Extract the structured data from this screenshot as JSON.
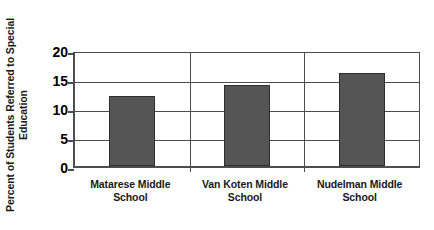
{
  "chart_data": {
    "type": "bar",
    "title": "",
    "xlabel": "",
    "ylabel_line1": "Percent of Students Referred to Special",
    "ylabel_line2": "Education",
    "ylabel": "Percent of Students Referred to Special Education",
    "categories": [
      "Matarese Middle School",
      "Van Koten Middle School",
      "Nudelman Middle School"
    ],
    "category_lines": [
      [
        "Matarese Middle",
        "School"
      ],
      [
        "Van Koten Middle",
        "School"
      ],
      [
        "Nudelman Middle",
        "School"
      ]
    ],
    "values": [
      12,
      14,
      16
    ],
    "ylim": [
      0,
      20
    ],
    "yticks": [
      0,
      5,
      10,
      15,
      20
    ],
    "ytick_labels": [
      "0",
      "5",
      "10",
      "15",
      "20"
    ],
    "grid": "horizontal-and-category-dividers",
    "legend": "none",
    "bar_color": "#555555",
    "bar_border_color": "#2e2e2e",
    "axis_color": "#4d4d4d",
    "background_color": "#ffffff",
    "text_color": "#1a1a1a"
  }
}
